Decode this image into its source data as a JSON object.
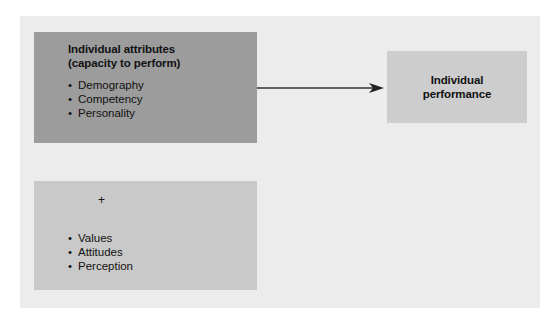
{
  "diagram": {
    "attributes_box": {
      "title_line1": "Individual attributes",
      "title_line2": "(capacity to perform)",
      "items": [
        "Demography",
        "Competency",
        "Personality"
      ]
    },
    "performance_box": {
      "title_line1": "Individual",
      "title_line2": "performance"
    },
    "other_box": {
      "plus": "+",
      "items": [
        "Values",
        "Attitudes",
        "Perception"
      ]
    },
    "bullet": "•",
    "colors": {
      "panel": "#ececec",
      "attributes_box": "#9c9c9c",
      "performance_box": "#cdcdcd",
      "other_box": "#c9c9c9",
      "arrow": "#333333"
    }
  }
}
